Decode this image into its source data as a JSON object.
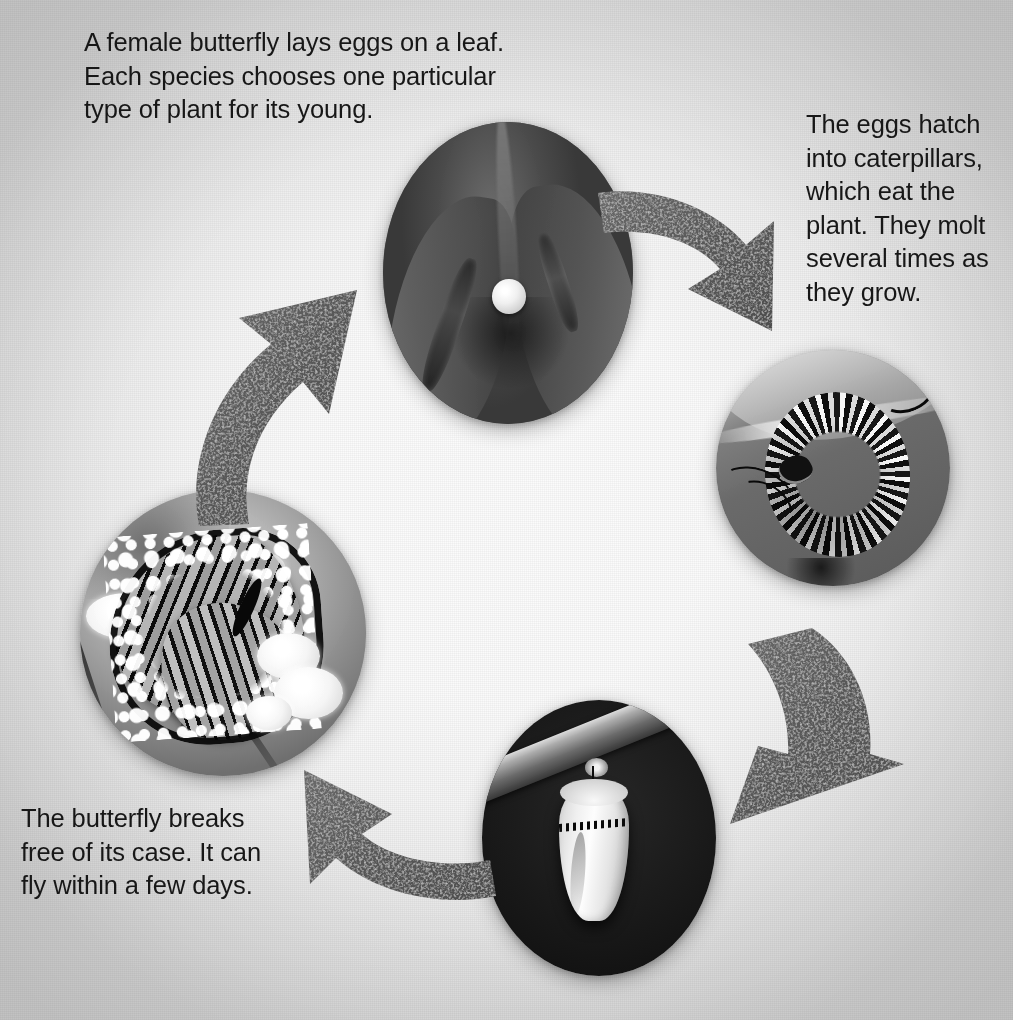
{
  "diagram": {
    "layout": "four photo circles arranged in a clockwise ring joined by four curved arrows",
    "background_color": "#fafafa",
    "edge_color": "#d6d6d6",
    "text_color": "#171717",
    "arrow_color": "#5e5e5e"
  },
  "captions": {
    "egg": "A female butterfly lays eggs on a leaf.\nEach species chooses one particular\ntype of plant for its young.",
    "caterpillar": "The eggs hatch\ninto caterpillars,\nwhich eat the\nplant. They molt\nseveral times as\nthey grow.",
    "butterfly": "The butterfly breaks\nfree of its case. It can\nfly within a few days."
  },
  "stages": [
    {
      "id": "egg",
      "name": "egg-photo",
      "alt": "Close-up of a single pale round butterfly egg on the underside of a dark leaf",
      "position": "top-center"
    },
    {
      "id": "caterpillar",
      "name": "caterpillar-photo",
      "alt": "Black, white and yellow striped monarch caterpillar curled on a milkweed leaf",
      "position": "right"
    },
    {
      "id": "chrysalis",
      "name": "chrysalis-photo",
      "alt": "Pale green chrysalis hanging from a twig against a dark background",
      "position": "bottom-center"
    },
    {
      "id": "butterfly",
      "name": "butterfly-photo",
      "alt": "Monarch butterfly with veined wings and white spots feeding on white flowers",
      "position": "left"
    }
  ],
  "arrows": [
    {
      "id": "egg-to-caterpillar",
      "name": "arrow-egg-to-caterpillar",
      "direction": "down-right"
    },
    {
      "id": "caterpillar-to-chrysalis",
      "name": "arrow-caterpillar-to-chrysalis",
      "direction": "down-left"
    },
    {
      "id": "chrysalis-to-butterfly",
      "name": "arrow-chrysalis-to-butterfly",
      "direction": "up-left"
    },
    {
      "id": "butterfly-to-egg",
      "name": "arrow-butterfly-to-egg",
      "direction": "up-right"
    }
  ]
}
